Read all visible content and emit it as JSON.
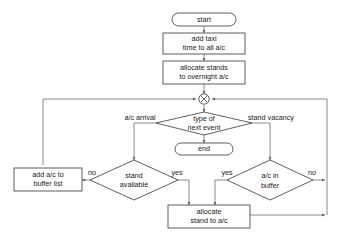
{
  "diagram": {
    "colors": {
      "background": "#ffffff",
      "node_stroke": "#4d4d4d",
      "connector_stroke": "#6b6b6b",
      "node_fill": "#ffffff",
      "text": "#1a1a1a"
    },
    "nodes": {
      "start": {
        "label": "start",
        "shape": "terminator"
      },
      "add_taxi": {
        "line1": "add taxi",
        "line2": "time to all a/c",
        "shape": "process"
      },
      "allocate_stands": {
        "line1": "allocate stands",
        "line2": "to overnight a/c",
        "shape": "process"
      },
      "merge": {
        "label": "",
        "shape": "merge-circle-x"
      },
      "type_of_next_event": {
        "line1": "type of",
        "line2": "next event",
        "shape": "decision"
      },
      "end": {
        "label": "end",
        "shape": "terminator"
      },
      "stand_available": {
        "line1": "stand",
        "line2": "available",
        "shape": "decision"
      },
      "ac_in_buffer": {
        "line1": "a/c in",
        "line2": "buffer",
        "shape": "decision"
      },
      "add_ac_buffer": {
        "line1": "add a/c to",
        "line2": "buffer list",
        "shape": "process"
      },
      "allocate_stand": {
        "line1": "allocate",
        "line2": "stand to a/c",
        "shape": "process"
      }
    },
    "edge_labels": {
      "ac_arrival": "a/c arrival",
      "stand_vacancy": "stand vacancy",
      "stand_available_no": "no",
      "stand_available_yes": "yes",
      "buffer_yes": "yes",
      "buffer_no": "no"
    },
    "caption": ""
  }
}
